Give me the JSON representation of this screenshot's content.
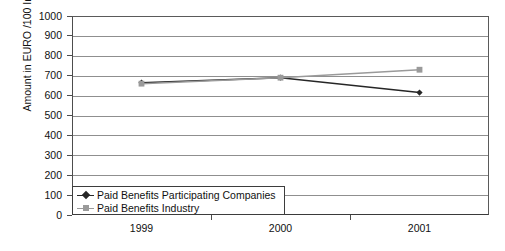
{
  "chart_data": {
    "type": "line",
    "title": "",
    "xlabel": "",
    "ylabel": "Amount in EURO /100 Insurance Years",
    "categories": [
      "1999",
      "2000",
      "2001"
    ],
    "ylim": [
      0,
      1000
    ],
    "ytick_step": 100,
    "yticks": [
      "1000",
      "900",
      "800",
      "700",
      "600",
      "500",
      "400",
      "300",
      "200",
      "100",
      "0"
    ],
    "grid": true,
    "legend_position": "inside-bottom-left",
    "series": [
      {
        "name": "Paid Benefits Participating Companies",
        "color": "#262626",
        "marker": "diamond",
        "values": [
          665,
          690,
          615
        ]
      },
      {
        "name": "Paid Benefits Industry",
        "color": "#9a9a9a",
        "marker": "square",
        "values": [
          660,
          690,
          730
        ]
      }
    ]
  },
  "legend": {
    "items": [
      {
        "label": "Paid Benefits Participating Companies"
      },
      {
        "label": "Paid Benefits Industry"
      }
    ]
  },
  "colors": {
    "series_dark": "#262626",
    "series_gray": "#9a9a9a",
    "axis": "#4d4d4d",
    "grid": "#8f8f8f",
    "background": "#ffffff"
  }
}
